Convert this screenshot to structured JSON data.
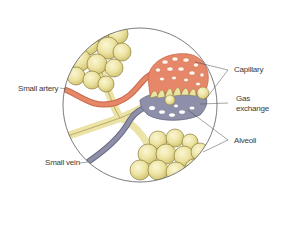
{
  "diagram": {
    "colors": {
      "artery": "#e7876a",
      "artery_dark": "#c8684c",
      "vein": "#8e8fa8",
      "vein_dark": "#676985",
      "alveoli": "#ece3a2",
      "alveoli_shade": "#d9cc7a",
      "outline": "#5a5a5a",
      "bronchiole": "#ebe3a8"
    },
    "labels": {
      "small_artery": "Small artery",
      "capillary": "Capillary",
      "gas_exchange_line1": "Gas",
      "gas_exchange_line2": "exchange",
      "alveoli": "Alveoli",
      "small_vein": "Small vein"
    }
  }
}
